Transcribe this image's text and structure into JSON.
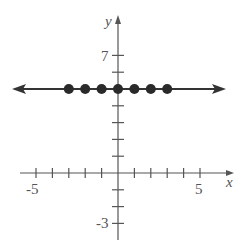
{
  "chart_data": {
    "type": "scatter",
    "title": "",
    "xlabel": "x",
    "ylabel": "y",
    "xlim": [
      -6,
      6.5
    ],
    "ylim": [
      -4,
      9
    ],
    "grid": false,
    "legend": null,
    "x_tick_labels": [
      {
        "value": -5,
        "label": "-5"
      },
      {
        "value": 5,
        "label": "5"
      }
    ],
    "y_tick_labels": [
      {
        "value": 7,
        "label": "7"
      },
      {
        "value": -3,
        "label": "-3"
      }
    ],
    "x_ticks": [
      -5,
      -4,
      -3,
      -2,
      -1,
      1,
      2,
      3,
      4,
      5
    ],
    "y_ticks": [
      -3,
      -2,
      -1,
      1,
      2,
      3,
      4,
      5,
      6,
      7
    ],
    "series": [
      {
        "name": "points",
        "marker": "filled-circle",
        "x": [
          -3,
          -2,
          -1,
          0,
          1,
          2,
          3
        ],
        "y": [
          5,
          5,
          5,
          5,
          5,
          5,
          5
        ]
      }
    ],
    "annotations": [
      {
        "type": "line",
        "description": "horizontal line y = 5 with arrows on both ends",
        "y": 5
      }
    ]
  },
  "labels": {
    "x_axis": "x",
    "y_axis": "y",
    "x_min_tick": "-5",
    "x_max_tick": "5",
    "y_max_tick": "7",
    "y_min_tick": "-3"
  },
  "colors": {
    "axis": "#555555",
    "line": "#333333",
    "point": "#2a2a2a"
  }
}
